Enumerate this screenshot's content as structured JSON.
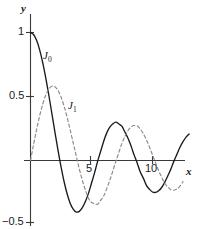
{
  "chart_data": {
    "type": "line",
    "title": "",
    "xlabel": "x",
    "ylabel": "y",
    "xlim": [
      -0.4,
      13.7
    ],
    "ylim": [
      -0.55,
      1.08
    ],
    "grid": false,
    "legend_position": "inline-annotation",
    "x_ticks": [
      {
        "value": 5,
        "label": "5"
      },
      {
        "value": 10,
        "label": "10"
      }
    ],
    "y_ticks": [
      {
        "value": 1,
        "label": "1"
      },
      {
        "value": 0.5,
        "label": "0.5"
      },
      {
        "value": -0.5,
        "label": "−0.5"
      }
    ],
    "annotations": [
      {
        "text": "J",
        "sub": "0",
        "x": 1.2,
        "y": 0.84
      },
      {
        "text": "J",
        "sub": "1",
        "x": 3.3,
        "y": 0.47
      }
    ],
    "series": [
      {
        "name": "J0",
        "label": "J",
        "sublabel": "0",
        "style": "solid",
        "color": "#1a1a1a",
        "x": [
          0,
          0.25,
          0.5,
          0.75,
          1,
          1.25,
          1.5,
          1.75,
          2,
          2.25,
          2.5,
          2.75,
          3,
          3.25,
          3.5,
          3.75,
          4,
          4.25,
          4.5,
          4.75,
          5,
          5.25,
          5.5,
          5.75,
          6,
          6.25,
          6.5,
          6.75,
          7,
          7.25,
          7.5,
          7.75,
          8,
          8.25,
          8.5,
          8.75,
          9,
          9.25,
          9.5,
          9.75,
          10,
          10.25,
          10.5,
          10.75,
          11,
          11.25,
          11.5,
          11.75,
          12,
          12.25,
          12.5,
          12.75,
          13
        ],
        "y": [
          1.0,
          0.9844,
          0.9385,
          0.8642,
          0.7652,
          0.6459,
          0.5118,
          0.369,
          0.2239,
          0.0827,
          -0.0484,
          -0.1641,
          -0.2601,
          -0.3332,
          -0.3801,
          -0.4026,
          -0.3971,
          -0.3686,
          -0.3205,
          -0.2566,
          -0.1776,
          -0.0968,
          -0.0068,
          0.0717,
          0.1506,
          0.2159,
          0.2601,
          0.2867,
          0.3001,
          0.2851,
          0.2663,
          0.2207,
          0.1717,
          0.1107,
          0.0419,
          -0.021,
          -0.0903,
          -0.1379,
          -0.1939,
          -0.2243,
          -0.2459,
          -0.249,
          -0.2366,
          -0.211,
          -0.1712,
          -0.1209,
          -0.0677,
          -0.0068,
          0.0477,
          0.1029,
          0.1469,
          0.183,
          0.2069
        ]
      },
      {
        "name": "J1",
        "label": "J",
        "sublabel": "1",
        "style": "dashed",
        "color": "#8a8a8a",
        "x": [
          0,
          0.25,
          0.5,
          0.75,
          1,
          1.25,
          1.5,
          1.75,
          2,
          2.25,
          2.5,
          2.75,
          3,
          3.25,
          3.5,
          3.75,
          4,
          4.25,
          4.5,
          4.75,
          5,
          5.25,
          5.5,
          5.75,
          6,
          6.25,
          6.5,
          6.75,
          7,
          7.25,
          7.5,
          7.75,
          8,
          8.25,
          8.5,
          8.75,
          9,
          9.25,
          9.5,
          9.75,
          10,
          10.25,
          10.5,
          10.75,
          11,
          11.25,
          11.5,
          11.75,
          12,
          12.25,
          12.5
        ],
        "y": [
          0.0,
          0.124,
          0.2423,
          0.3492,
          0.4401,
          0.5106,
          0.5579,
          0.5802,
          0.5767,
          0.5484,
          0.4971,
          0.4256,
          0.3391,
          0.2404,
          0.1374,
          0.0366,
          -0.066,
          -0.1538,
          -0.2311,
          -0.2951,
          -0.3276,
          -0.3371,
          -0.3414,
          -0.311,
          -0.2767,
          -0.2196,
          -0.1538,
          -0.0819,
          -0.0047,
          0.0651,
          0.1352,
          0.1907,
          0.2346,
          0.2623,
          0.2731,
          0.2697,
          0.2453,
          0.2095,
          0.1613,
          0.1061,
          0.0435,
          -0.0184,
          -0.0789,
          -0.13,
          -0.1768,
          -0.206,
          -0.2284,
          -0.232,
          -0.2234,
          -0.2001,
          -0.1655
        ]
      }
    ]
  }
}
